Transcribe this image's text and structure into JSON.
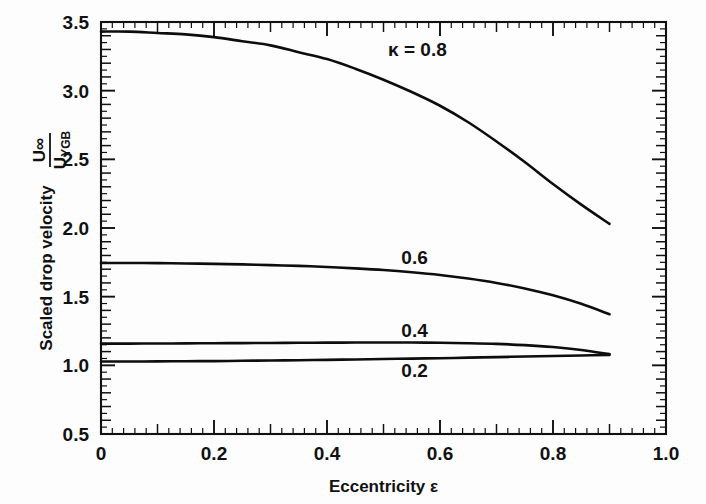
{
  "chart_data": {
    "type": "line",
    "title": "",
    "xlabel": "Eccentricity ε",
    "ylabel": "Scaled drop velocity",
    "ylabel_fraction_numerator": "U∞",
    "ylabel_fraction_denominator": "UYGB",
    "ylabel_fraction_denominator_base": "U",
    "ylabel_fraction_denominator_sub": "YGB",
    "xlim": [
      0,
      1.0
    ],
    "ylim": [
      0.5,
      3.5
    ],
    "xticks": [
      "0",
      "0.2",
      "0.4",
      "0.6",
      "0.8",
      "1.0"
    ],
    "xtick_values": [
      0,
      0.2,
      0.4,
      0.6,
      0.8,
      1.0
    ],
    "yticks": [
      "0.5",
      "1.0",
      "1.5",
      "2.0",
      "2.5",
      "3.0",
      "3.5"
    ],
    "ytick_values": [
      0.5,
      1.0,
      1.5,
      2.0,
      2.5,
      3.0,
      3.5
    ],
    "x_minor_step": 0.02,
    "x_mid_step": 0.1,
    "y_minor_step": 0.05,
    "y_mid_step": 0.1,
    "grid": false,
    "legend_position": "inline-labels",
    "series": [
      {
        "name": "κ = 0.8",
        "label": "κ = 0.8",
        "label_x": 0.56,
        "label_y": 3.3,
        "x": [
          0.0,
          0.05,
          0.1,
          0.15,
          0.2,
          0.25,
          0.3,
          0.35,
          0.4,
          0.45,
          0.5,
          0.55,
          0.6,
          0.65,
          0.7,
          0.75,
          0.8,
          0.85,
          0.9
        ],
        "values": [
          3.43,
          3.43,
          3.42,
          3.41,
          3.39,
          3.36,
          3.33,
          3.28,
          3.23,
          3.16,
          3.08,
          2.99,
          2.89,
          2.77,
          2.63,
          2.48,
          2.32,
          2.17,
          2.03
        ]
      },
      {
        "name": "0.6",
        "label": "0.6",
        "label_x": 0.555,
        "label_y": 1.79,
        "x": [
          0.0,
          0.05,
          0.1,
          0.15,
          0.2,
          0.25,
          0.3,
          0.35,
          0.4,
          0.45,
          0.5,
          0.55,
          0.6,
          0.65,
          0.7,
          0.75,
          0.8,
          0.85,
          0.9
        ],
        "values": [
          1.745,
          1.745,
          1.744,
          1.742,
          1.739,
          1.735,
          1.73,
          1.724,
          1.716,
          1.706,
          1.694,
          1.678,
          1.658,
          1.632,
          1.6,
          1.56,
          1.51,
          1.448,
          1.372
        ]
      },
      {
        "name": "0.4",
        "label": "0.4",
        "label_x": 0.555,
        "label_y": 1.255,
        "x": [
          0.0,
          0.05,
          0.1,
          0.15,
          0.2,
          0.25,
          0.3,
          0.35,
          0.4,
          0.45,
          0.5,
          0.55,
          0.6,
          0.65,
          0.7,
          0.75,
          0.8,
          0.85,
          0.9
        ],
        "values": [
          1.158,
          1.158,
          1.159,
          1.16,
          1.161,
          1.162,
          1.163,
          1.164,
          1.165,
          1.166,
          1.166,
          1.166,
          1.164,
          1.161,
          1.156,
          1.147,
          1.133,
          1.112,
          1.082
        ]
      },
      {
        "name": "0.2",
        "label": "0.2",
        "label_x": 0.555,
        "label_y": 0.965,
        "x": [
          0.0,
          0.05,
          0.1,
          0.15,
          0.2,
          0.25,
          0.3,
          0.35,
          0.4,
          0.45,
          0.5,
          0.55,
          0.6,
          0.65,
          0.7,
          0.75,
          0.8,
          0.85,
          0.9
        ],
        "values": [
          1.028,
          1.028,
          1.029,
          1.03,
          1.031,
          1.033,
          1.035,
          1.037,
          1.04,
          1.043,
          1.046,
          1.049,
          1.052,
          1.056,
          1.06,
          1.064,
          1.068,
          1.072,
          1.076
        ]
      }
    ]
  },
  "colors": {
    "curve": "#0d0d0d",
    "axis": "#111111",
    "background": "#fdfdfd"
  }
}
